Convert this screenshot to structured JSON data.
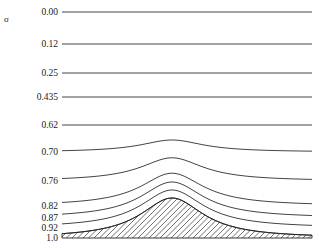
{
  "figure": {
    "axis_title": "σ",
    "background_color": "#ffffff",
    "line_color": "#222222",
    "hatch_color": "#333333",
    "width": 318,
    "height": 249
  },
  "axis": {
    "tick_labels": [
      "0.00",
      "0.12",
      "0.25",
      "0.435",
      "0.62",
      "0.70",
      "0.76",
      "0.82",
      "0.87",
      "0.92",
      "1.0"
    ],
    "label_right_edge_x": 58,
    "tick_y_positions": [
      12,
      44,
      73,
      97,
      125,
      152,
      181,
      206,
      218,
      228,
      238
    ]
  },
  "chart_data": {
    "type": "line",
    "title": "",
    "xlabel": "",
    "ylabel": "σ",
    "grid": false,
    "legend": null,
    "ylim": [
      0.0,
      1.0
    ],
    "y_inverted": true,
    "xlim": [
      62,
      312
    ],
    "terrain": {
      "name": "mountain",
      "base_y": 238,
      "peak_x": 172,
      "peak_y": 198,
      "left_base_x": 95,
      "right_base_x": 258,
      "hatched": true,
      "hatch_angle_deg": 45,
      "hatch_spacing_px": 5.5
    },
    "levels": [
      {
        "sigma": "0.00",
        "baseline_y": 12,
        "terrain_follow": 0.0
      },
      {
        "sigma": "0.12",
        "baseline_y": 44,
        "terrain_follow": 0.0
      },
      {
        "sigma": "0.25",
        "baseline_y": 73,
        "terrain_follow": 0.0
      },
      {
        "sigma": "0.435",
        "baseline_y": 97,
        "terrain_follow": 0.0
      },
      {
        "sigma": "0.62",
        "baseline_y": 125,
        "terrain_follow": 0.0
      },
      {
        "sigma": "0.70",
        "baseline_y": 152,
        "terrain_follow": 0.3
      },
      {
        "sigma": "0.76",
        "baseline_y": 181,
        "terrain_follow": 0.58
      },
      {
        "sigma": "0.82",
        "baseline_y": 206,
        "terrain_follow": 0.82
      },
      {
        "sigma": "0.87",
        "baseline_y": 218,
        "terrain_follow": 0.9
      },
      {
        "sigma": "0.92",
        "baseline_y": 228,
        "terrain_follow": 0.95
      },
      {
        "sigma": "1.0",
        "baseline_y": 238,
        "terrain_follow": 1.0
      }
    ]
  }
}
